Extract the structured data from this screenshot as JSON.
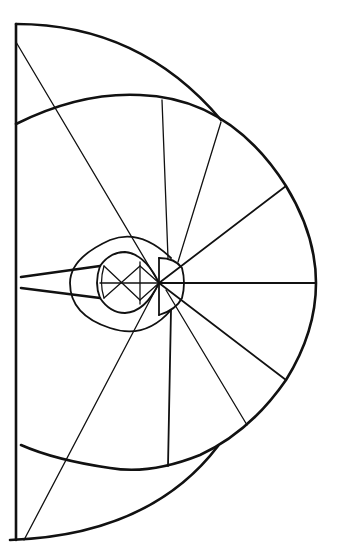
{
  "diagram": {
    "stroke_color": "#111111",
    "background": "#ffffff",
    "focal_point": [
      159,
      283
    ],
    "left_axis": {
      "x": 16,
      "y_top": 24,
      "y_bottom": 540
    },
    "outer_right_extent": [
      316,
      283
    ],
    "radial_lines": [
      {
        "from": [
          16,
          42
        ],
        "to": [
          159,
          283
        ]
      },
      {
        "from": [
          162,
          100
        ],
        "to": [
          168,
          258
        ]
      },
      {
        "from": [
          221,
          122
        ],
        "to": [
          178,
          262
        ]
      },
      {
        "from": [
          286,
          186
        ],
        "to": [
          182,
          268
        ]
      },
      {
        "from": [
          316,
          283
        ],
        "to": [
          183,
          283
        ]
      },
      {
        "from": [
          286,
          380
        ],
        "to": [
          182,
          298
        ]
      },
      {
        "from": [
          247,
          425
        ],
        "to": [
          180,
          305
        ]
      },
      {
        "from": [
          168,
          466
        ],
        "to": [
          171,
          310
        ]
      },
      {
        "from": [
          24,
          540
        ],
        "to": [
          159,
          283
        ]
      }
    ],
    "labels": []
  }
}
